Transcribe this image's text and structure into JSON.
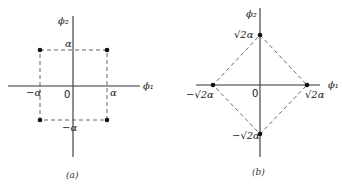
{
  "panels": [
    {
      "id": "a",
      "caption": "(a)",
      "axes": {
        "x_label": "ϕ₁",
        "y_label": "ϕ₂",
        "origin_label": "0"
      },
      "tick_labels": {
        "x_pos": "α",
        "x_neg": "−α",
        "y_pos": "α",
        "y_neg": "−α"
      },
      "points": [
        {
          "phi1": "α",
          "phi2": "α"
        },
        {
          "phi1": "−α",
          "phi2": "α"
        },
        {
          "phi1": "−α",
          "phi2": "−α"
        },
        {
          "phi1": "α",
          "phi2": "−α"
        }
      ],
      "shape": "square (dashed)"
    },
    {
      "id": "b",
      "caption": "(b)",
      "axes": {
        "x_label": "ϕ₁",
        "y_label": "ϕ₂",
        "origin_label": "0"
      },
      "tick_labels": {
        "x_pos": "√2α",
        "x_neg": "−√2α",
        "y_pos": "√2α",
        "y_neg": "−√2α"
      },
      "points": [
        {
          "phi1": "0",
          "phi2": "√2α"
        },
        {
          "phi1": "−√2α",
          "phi2": "0"
        },
        {
          "phi1": "0",
          "phi2": "−√2α"
        },
        {
          "phi1": "√2α",
          "phi2": "0"
        }
      ],
      "shape": "diamond (dashed)"
    }
  ]
}
